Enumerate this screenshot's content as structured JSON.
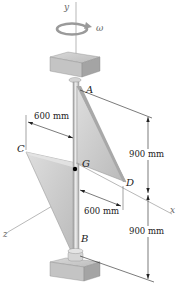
{
  "diagram": {
    "type": "mechanics-figure",
    "axes": {
      "y": "y",
      "x": "x",
      "z": "z"
    },
    "rotation_label": "ω",
    "points": {
      "A": "A",
      "B": "B",
      "C": "C",
      "D": "D",
      "G": "G"
    },
    "dimensions": {
      "upper_plate_width": "600 mm",
      "lower_plate_width": "600 mm",
      "upper_height": "900 mm",
      "lower_height": "900 mm"
    },
    "colors": {
      "plate_fill": "#c8c8c8",
      "plate_edge": "#9a9a9a",
      "shaft": "#d6d6d6",
      "bearing_block": "#bdbdbd",
      "axis_line": "#888888",
      "dimension_line": "#222222",
      "center_dot": "#000000"
    }
  }
}
